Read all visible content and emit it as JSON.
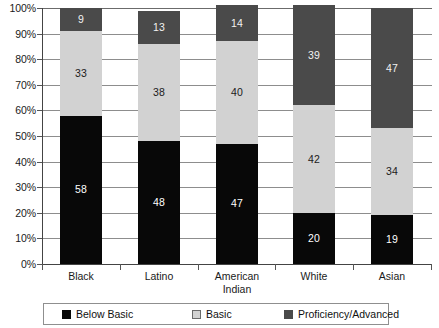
{
  "chart_data": {
    "type": "bar",
    "subtype": "stacked-bar-100",
    "title": "",
    "xlabel": "",
    "ylabel": "",
    "ylim": [
      0,
      100
    ],
    "grid": true,
    "legend_position": "bottom",
    "categories": [
      "Black",
      "Latino",
      "American\nIndian",
      "White",
      "Asian"
    ],
    "y_tick_labels": [
      "0%",
      "10%",
      "20%",
      "30%",
      "40%",
      "50%",
      "60%",
      "70%",
      "80%",
      "90%",
      "100%"
    ],
    "y_tick_values": [
      0,
      10,
      20,
      30,
      40,
      50,
      60,
      70,
      80,
      90,
      100
    ],
    "series": [
      {
        "name": "Below Basic",
        "color": "#080808",
        "values": [
          58,
          48,
          47,
          20,
          19
        ],
        "labels": [
          "58",
          "48",
          "47",
          "20",
          "19"
        ]
      },
      {
        "name": "Basic",
        "color": "#d2d2d2",
        "values": [
          33,
          38,
          40,
          42,
          34
        ],
        "labels": [
          "33",
          "38",
          "40",
          "42",
          "34"
        ]
      },
      {
        "name": "Proficiency/Advanced",
        "color": "#4a4a4a",
        "values": [
          9,
          13,
          14,
          39,
          47
        ],
        "labels": [
          "9",
          "13",
          "14",
          "39",
          "47"
        ]
      }
    ]
  },
  "legend": {
    "items": [
      {
        "label": "Below Basic",
        "color": "#080808"
      },
      {
        "label": "Basic",
        "color": "#d2d2d2"
      },
      {
        "label": "Proficiency/Advanced",
        "color": "#4a4a4a"
      }
    ]
  },
  "colors": {
    "below_basic": "#080808",
    "basic": "#d2d2d2",
    "proficiency": "#4a4a4a",
    "gridline": "#8d8d8d",
    "axis": "#444444",
    "background": "#ffffff"
  }
}
